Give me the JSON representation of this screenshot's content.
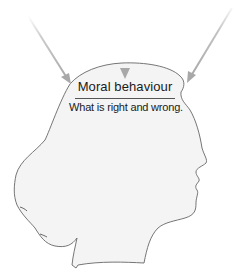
{
  "diagram": {
    "title": "Moral behaviour",
    "subtitle": "What is right and wrong.",
    "shape": "head-silhouette-profile",
    "arrow_count": 3,
    "arrows": [
      {
        "name": "left-arrow",
        "direction": "down-right"
      },
      {
        "name": "center-arrow",
        "direction": "down"
      },
      {
        "name": "right-arrow",
        "direction": "down-left"
      }
    ],
    "colors": {
      "head_fill": "#f4f4f4",
      "head_outline": "#666666",
      "arrow": "#a8a8a8",
      "text": "#1a1a1a"
    }
  }
}
